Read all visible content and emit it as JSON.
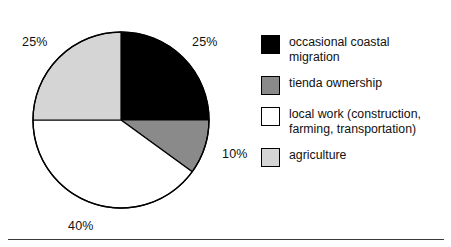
{
  "chart_data": {
    "type": "pie",
    "title": "",
    "subtitle": "",
    "xlabel": "",
    "ylabel": "",
    "grid": false,
    "legend_position": "right",
    "start_angle_deg": 0,
    "direction": "clockwise",
    "categories": [
      "occasional coastal migration",
      "tienda ownership",
      "local work (construction, farming, transportation)",
      "agriculture"
    ],
    "values": [
      25,
      10,
      40,
      25
    ],
    "value_unit": "%",
    "data_labels": [
      "25%",
      "10%",
      "40%",
      "25%"
    ],
    "colors": [
      "#000000",
      "#8a8a8a",
      "#ffffff",
      "#d5d5d5"
    ],
    "slices": [
      {
        "label": "occasional coastal migration",
        "value": 25,
        "data_label": "25%",
        "color": "#000000",
        "start_deg": 0,
        "end_deg": 90
      },
      {
        "label": "tienda ownership",
        "value": 10,
        "data_label": "10%",
        "color": "#8a8a8a",
        "start_deg": 90,
        "end_deg": 126
      },
      {
        "label": "local work (construction, farming, transportation)",
        "value": 40,
        "data_label": "40%",
        "color": "#ffffff",
        "start_deg": 126,
        "end_deg": 270
      },
      {
        "label": "agriculture",
        "value": 25,
        "data_label": "25%",
        "color": "#d5d5d5",
        "start_deg": 270,
        "end_deg": 360
      }
    ]
  },
  "pie": {
    "center_x": 121,
    "center_y": 120,
    "radius": 88,
    "outline_color": "#000000",
    "labels": {
      "agriculture_pct": "25%",
      "migration_pct": "25%",
      "tienda_pct": "10%",
      "localwork_pct": "40%"
    }
  },
  "legend": {
    "items": [
      {
        "label_line1": "occasional coastal",
        "label_line2": "migration",
        "swatch_color": "#000000",
        "swatch_name": "legend-swatch-black"
      },
      {
        "label_line1": "tienda ownership",
        "label_line2": "",
        "swatch_color": "#8a8a8a",
        "swatch_name": "legend-swatch-gray"
      },
      {
        "label_line1": "local work (construction,",
        "label_line2": "farming, transportation)",
        "swatch_color": "#ffffff",
        "swatch_name": "legend-swatch-white"
      },
      {
        "label_line1": "agriculture",
        "label_line2": "",
        "swatch_color": "#d5d5d5",
        "swatch_name": "legend-swatch-lightgray"
      }
    ]
  }
}
